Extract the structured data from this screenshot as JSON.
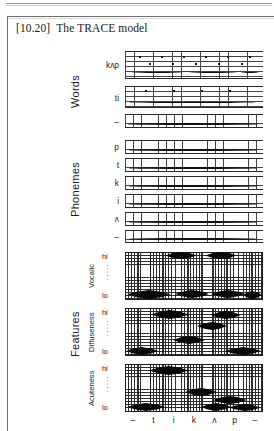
{
  "figure": {
    "number": "[10.20]",
    "title": "The TRACE model"
  },
  "tiers": [
    {
      "name": "Words",
      "label": "Words",
      "rows": [
        {
          "label": "kʌp"
        },
        {
          "label": "ti"
        },
        {
          "label": "–"
        }
      ]
    },
    {
      "name": "Phonemes",
      "label": "Phonemes",
      "rows": [
        {
          "label": "p"
        },
        {
          "label": "t"
        },
        {
          "label": "k"
        },
        {
          "label": "i"
        },
        {
          "label": "ʌ"
        },
        {
          "label": "–"
        }
      ]
    },
    {
      "name": "Features",
      "label": "Features",
      "rows": [
        {
          "label": "Vocalic",
          "hi": "hi",
          "lo": "lo",
          "dots": "·····"
        },
        {
          "label": "Diffuseness",
          "hi": "hi",
          "lo": "lo",
          "dots": "·····"
        },
        {
          "label": "Acuteness",
          "hi": "hi",
          "lo": "lo",
          "dots": "·····"
        }
      ]
    }
  ],
  "axis": {
    "ticks": [
      "–",
      "t",
      "i",
      "k",
      "ʌ",
      "p",
      "–"
    ]
  },
  "colors": {
    "ink": "#1b1b1b",
    "grid": "#2e2e2e",
    "blob": "#070707",
    "frame": "#6f6f6f",
    "paper": "#ffffff"
  }
}
